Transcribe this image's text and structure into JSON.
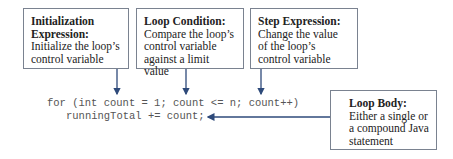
{
  "boxes": {
    "initialization": {
      "title": "Initialization Expression:",
      "description": "Initialize the loop’s control variable"
    },
    "condition": {
      "title": "Loop Condition:",
      "description": "Compare the loop’s control variable against a limit value"
    },
    "step": {
      "title": "Step Expression:",
      "description": "Change the value of the loop’s control variable"
    },
    "body": {
      "title": "Loop Body:",
      "description": "Either a single or a compound Java statement"
    }
  },
  "code": {
    "line1": "for (int count = 1; count <= n; count++)",
    "line2": "runningTotal += count;"
  },
  "colors": {
    "arrow": "#2e4a7a",
    "border": "#7a8290"
  }
}
